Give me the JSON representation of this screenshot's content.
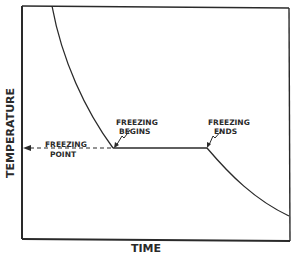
{
  "diagram": {
    "title": "",
    "axes": {
      "y_label": "TEMPERATURE",
      "x_label": "TIME"
    },
    "annotations": {
      "freezing_point": [
        "FREEZING",
        "POINT"
      ],
      "freezing_begins": [
        "FREEZING",
        "BEGINS"
      ],
      "freezing_ends": [
        "FREEZING",
        "ENDS"
      ]
    },
    "colors": {
      "line": "#2a2a2a",
      "background": "#ffffff"
    }
  }
}
